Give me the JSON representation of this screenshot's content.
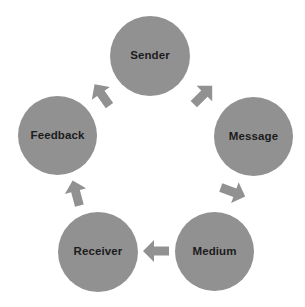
{
  "diagram": {
    "type": "cycle",
    "background_color": "#ffffff",
    "node_color": "#919191",
    "arrow_color": "#919191",
    "label_color": "#1c1c1c",
    "nodes": [
      {
        "id": "sender",
        "label": "Sender",
        "order": 1,
        "center_x": 150,
        "center_y": 56,
        "diameter": 80
      },
      {
        "id": "message",
        "label": "Message",
        "order": 2,
        "center_x": 254,
        "center_y": 136,
        "diameter": 79
      },
      {
        "id": "medium",
        "label": "Medium",
        "order": 3,
        "center_x": 214,
        "center_y": 251,
        "diameter": 79
      },
      {
        "id": "receiver",
        "label": "Receiver",
        "order": 4,
        "center_x": 98,
        "center_y": 252,
        "diameter": 80
      },
      {
        "id": "feedback",
        "label": "Feedback",
        "order": 5,
        "center_x": 58,
        "center_y": 135,
        "diameter": 79
      }
    ],
    "arrows": [
      {
        "id": "sender-to-message",
        "from": "sender",
        "to": "message",
        "direction": "down-right",
        "rotation_deg": 135,
        "center_x": 203,
        "center_y": 95
      },
      {
        "id": "message-to-medium",
        "from": "message",
        "to": "medium",
        "direction": "down-left",
        "rotation_deg": 200,
        "center_x": 233,
        "center_y": 192
      },
      {
        "id": "medium-to-receiver",
        "from": "medium",
        "to": "receiver",
        "direction": "left",
        "rotation_deg": 270,
        "center_x": 156,
        "center_y": 251
      },
      {
        "id": "receiver-to-feedback",
        "from": "receiver",
        "to": "feedback",
        "direction": "up-left",
        "rotation_deg": 345,
        "center_x": 76,
        "center_y": 193
      },
      {
        "id": "feedback-to-sender",
        "from": "feedback",
        "to": "sender",
        "direction": "up-right",
        "rotation_deg": 55,
        "center_x": 102,
        "center_y": 95
      }
    ]
  }
}
